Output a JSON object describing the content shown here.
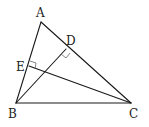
{
  "figure": {
    "type": "triangle-with-altitudes",
    "points": {
      "A": {
        "label": "A"
      },
      "B": {
        "label": "B"
      },
      "C": {
        "label": "C"
      },
      "D": {
        "label": "D"
      },
      "E": {
        "label": "E"
      }
    },
    "segments": [
      "AB",
      "AC",
      "BC",
      "BD",
      "CE"
    ],
    "right_angles": [
      {
        "at": "D",
        "between": [
          "BD",
          "AC"
        ]
      },
      {
        "at": "E",
        "between": [
          "CE",
          "AB"
        ]
      }
    ]
  }
}
